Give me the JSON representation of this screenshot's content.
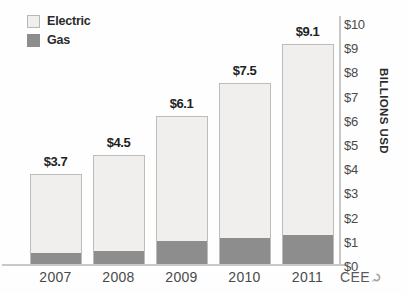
{
  "chart_data": {
    "type": "bar",
    "subtype": "stacked-bar",
    "title": "",
    "xlabel": "",
    "ylabel": "BILLIONS USD",
    "categories": [
      "2007",
      "2008",
      "2009",
      "2010",
      "2011"
    ],
    "series": [
      {
        "name": "Gas",
        "values": [
          0.45,
          0.55,
          0.95,
          1.1,
          1.2
        ],
        "color": "#8d8d8d"
      },
      {
        "name": "Electric",
        "values": [
          3.25,
          3.95,
          5.15,
          6.4,
          7.9
        ],
        "color": "#f0efed"
      }
    ],
    "totals": [
      3.7,
      4.5,
      6.1,
      7.5,
      9.1
    ],
    "data_labels": [
      "$3.7",
      "$4.5",
      "$6.1",
      "$7.5",
      "$9.1"
    ],
    "ylim": [
      0,
      10
    ],
    "ytick_values": [
      0,
      1,
      2,
      3,
      4,
      5,
      6,
      7,
      8,
      9,
      10
    ],
    "ytick_labels": [
      "$0",
      "$1",
      "$2",
      "$3",
      "$4",
      "$5",
      "$6",
      "$7",
      "$8",
      "$9",
      "$10"
    ],
    "y_axis_position": "right",
    "grid": false,
    "legend_position": "top-left",
    "legend_entries": [
      "Electric",
      "Gas"
    ]
  },
  "legend": {
    "electric_label": "Electric",
    "gas_label": "Gas"
  },
  "axis": {
    "y_title": "BILLIONS USD"
  },
  "watermark": {
    "text": "CEE",
    "mark_name": "cee-logo-mark"
  },
  "colors": {
    "electric": "#f0efed",
    "electric_border": "#bdbcb9",
    "gas": "#8d8d8d",
    "axis": "#c9c8c6",
    "text": "#1f1f1f",
    "tick_text": "#4a4a4a"
  }
}
